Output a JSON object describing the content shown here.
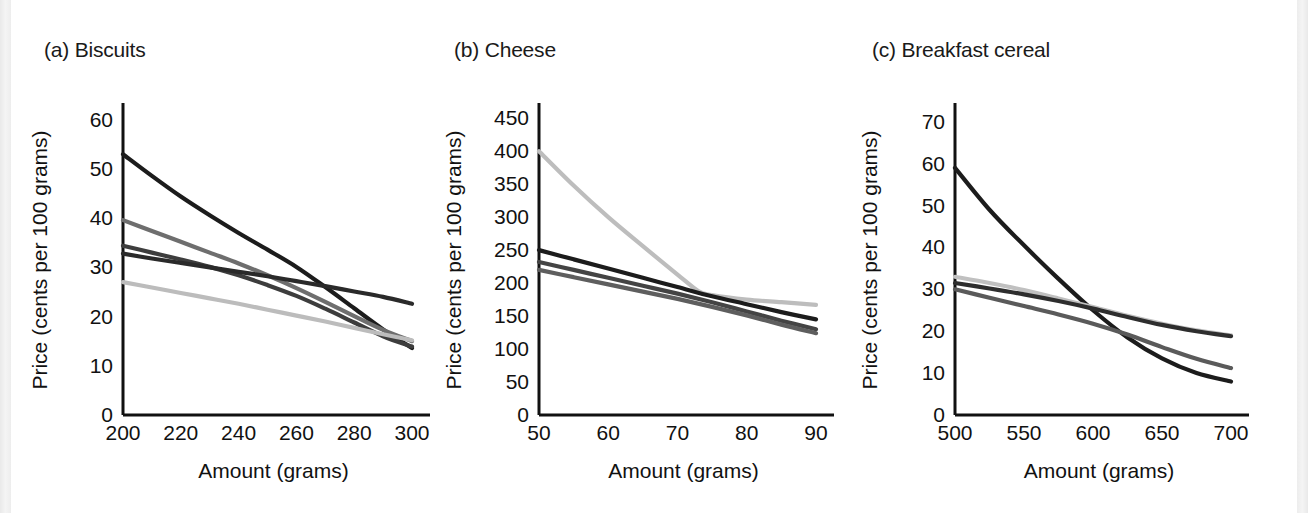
{
  "figure": {
    "background_color": "#ffffff",
    "edge_strip_color": "#ededed",
    "axis_color": "#111111"
  },
  "chart_data": [
    {
      "type": "line",
      "panel_id": "a",
      "title": "(a) Biscuits",
      "xlabel": "Amount (grams)",
      "ylabel": "Price (cents per 100 grams)",
      "xlim": [
        200,
        300
      ],
      "ylim": [
        0,
        63
      ],
      "xticks": [
        200,
        220,
        240,
        260,
        280,
        300
      ],
      "yticks": [
        0,
        10,
        20,
        30,
        40,
        50,
        60
      ],
      "grid": false,
      "legend": "none",
      "series": [
        {
          "name": "series-1",
          "color": "#1c1c1c",
          "x": [
            200,
            210,
            220,
            230,
            240,
            250,
            260,
            270,
            280,
            290,
            300
          ],
          "values": [
            53.0,
            48.6,
            44.4,
            40.6,
            37.0,
            33.6,
            30.1,
            26.0,
            21.7,
            17.4,
            13.6
          ]
        },
        {
          "name": "series-2",
          "color": "#6e6e6e",
          "x": [
            200,
            210,
            220,
            230,
            240,
            250,
            260,
            270,
            280,
            290,
            300
          ],
          "values": [
            39.6,
            37.4,
            35.2,
            33.0,
            30.8,
            28.4,
            25.8,
            23.0,
            20.1,
            17.3,
            15.0
          ]
        },
        {
          "name": "series-3",
          "color": "#3d3d3d",
          "x": [
            200,
            210,
            220,
            230,
            240,
            250,
            260,
            270,
            280,
            290,
            300
          ],
          "values": [
            34.4,
            33.0,
            31.6,
            30.1,
            28.4,
            26.4,
            24.2,
            21.6,
            18.8,
            16.0,
            13.9
          ]
        },
        {
          "name": "series-4",
          "color": "#2a2a2a",
          "x": [
            200,
            210,
            220,
            230,
            240,
            250,
            260,
            270,
            280,
            290,
            300
          ],
          "values": [
            32.8,
            31.8,
            30.9,
            30.0,
            29.1,
            28.2,
            27.2,
            26.2,
            25.1,
            24.0,
            22.6
          ]
        },
        {
          "name": "series-5",
          "color": "#bcbcbc",
          "x": [
            200,
            210,
            220,
            230,
            240,
            250,
            260,
            270,
            280,
            290,
            300
          ],
          "values": [
            27.0,
            25.9,
            24.8,
            23.7,
            22.6,
            21.4,
            20.2,
            19.0,
            17.7,
            16.4,
            15.2
          ]
        }
      ]
    },
    {
      "type": "line",
      "panel_id": "b",
      "title": "(b) Cheese",
      "xlabel": "Amount (grams)",
      "ylabel": "Price (cents per 100 grams)",
      "xlim": [
        50,
        90
      ],
      "ylim": [
        0,
        470
      ],
      "xticks": [
        50,
        60,
        70,
        80,
        90
      ],
      "yticks": [
        0,
        50,
        100,
        150,
        200,
        250,
        300,
        350,
        400,
        450
      ],
      "grid": false,
      "legend": "none",
      "series": [
        {
          "name": "series-1",
          "color": "#bdbdbd",
          "x": [
            50,
            55,
            60,
            65,
            70,
            73,
            75,
            80,
            85,
            90
          ],
          "values": [
            400,
            348,
            300,
            256,
            213,
            188,
            182,
            175,
            171,
            167
          ]
        },
        {
          "name": "series-2",
          "color": "#1c1c1c",
          "x": [
            50,
            55,
            60,
            65,
            70,
            75,
            80,
            85,
            90
          ],
          "values": [
            250,
            236,
            222,
            208,
            194,
            180,
            168,
            156,
            145
          ]
        },
        {
          "name": "series-3",
          "color": "#444444",
          "x": [
            50,
            55,
            60,
            65,
            70,
            75,
            80,
            85,
            90
          ],
          "values": [
            232,
            220,
            208,
            196,
            184,
            171,
            157,
            143,
            130
          ]
        },
        {
          "name": "series-4",
          "color": "#5e5e5e",
          "x": [
            50,
            55,
            60,
            65,
            70,
            75,
            80,
            85,
            90
          ],
          "values": [
            220,
            209,
            198,
            187,
            176,
            164,
            151,
            137,
            124
          ]
        }
      ]
    },
    {
      "type": "line",
      "panel_id": "c",
      "title": "(c) Breakfast cereal",
      "xlabel": "Amount (grams)",
      "ylabel": "Price (cents per 100 grams)",
      "xlim": [
        500,
        700
      ],
      "ylim": [
        0,
        74
      ],
      "xticks": [
        500,
        550,
        600,
        650,
        700
      ],
      "yticks": [
        0,
        10,
        20,
        30,
        40,
        50,
        60,
        70
      ],
      "grid": false,
      "legend": "none",
      "series": [
        {
          "name": "series-1",
          "color": "#1c1c1c",
          "x": [
            500,
            525,
            550,
            575,
            600,
            625,
            650,
            675,
            700
          ],
          "values": [
            59.0,
            49.0,
            40.5,
            32.5,
            25.0,
            18.5,
            13.5,
            10.0,
            8.0
          ]
        },
        {
          "name": "series-2",
          "color": "#c0c0c0",
          "x": [
            500,
            525,
            550,
            575,
            600,
            625,
            650,
            675,
            700
          ],
          "values": [
            33.0,
            31.5,
            29.8,
            27.8,
            25.8,
            23.7,
            21.8,
            20.2,
            19.0
          ]
        },
        {
          "name": "series-3",
          "color": "#2e2e2e",
          "x": [
            500,
            525,
            550,
            575,
            600,
            625,
            650,
            675,
            700
          ],
          "values": [
            31.5,
            30.2,
            28.8,
            27.2,
            25.4,
            23.4,
            21.5,
            20.0,
            18.8
          ]
        },
        {
          "name": "series-4",
          "color": "#5a5a5a",
          "x": [
            500,
            525,
            550,
            575,
            600,
            625,
            650,
            675,
            700
          ],
          "values": [
            30.0,
            28.0,
            26.0,
            24.0,
            21.8,
            19.2,
            16.2,
            13.4,
            11.2
          ]
        }
      ]
    }
  ]
}
